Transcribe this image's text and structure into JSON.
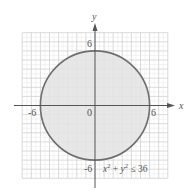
{
  "figure": {
    "axes": {
      "x_label": "x",
      "y_label": "y",
      "range": [
        -8,
        8
      ],
      "tick_labels": {
        "x_neg": "-6",
        "x_pos": "6",
        "y_pos": "6",
        "y_neg": "-6",
        "origin": "0"
      }
    },
    "region": {
      "shape": "disk",
      "center": [
        0,
        0
      ],
      "radius": 6,
      "inequality": "x² + y² ≤ 36",
      "inequality_parts": {
        "x": "x",
        "sup1": "2",
        "plus": " + ",
        "y": "y",
        "sup2": "2",
        "rel": " ≤ 36"
      },
      "fill_color": "#e3e3e3",
      "stroke_color": "#6e6e6e"
    },
    "grid_color_major": "#d0d0d0",
    "grid_color_minor": "#e6e6e6",
    "axis_color": "#555555"
  }
}
